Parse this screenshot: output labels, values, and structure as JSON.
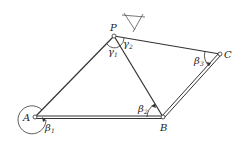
{
  "diagram": {
    "type": "four-bar linkage / planar mechanism",
    "points": {
      "A": {
        "label": "A",
        "x": 35,
        "y": 117
      },
      "B": {
        "label": "B",
        "x": 163,
        "y": 117
      },
      "C": {
        "label": "C",
        "x": 220,
        "y": 54
      },
      "P": {
        "label": "P",
        "x": 114,
        "y": 36
      }
    },
    "angles": [
      {
        "symbol": "β",
        "sub": "1",
        "at": "A"
      },
      {
        "symbol": "β",
        "sub": "2",
        "at": "B"
      },
      {
        "symbol": "β",
        "sub": "3",
        "at": "C"
      },
      {
        "symbol": "γ",
        "sub": "1",
        "at": "P"
      },
      {
        "symbol": "γ",
        "sub": "2",
        "at": "P"
      }
    ],
    "colors": {
      "line": "#333333",
      "background": "#ffffff"
    }
  }
}
